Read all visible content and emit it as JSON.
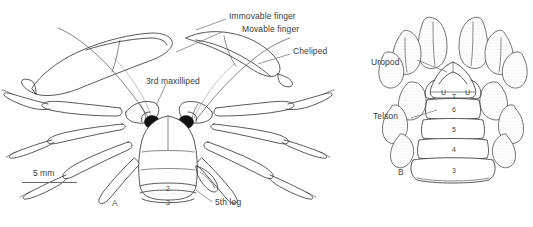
{
  "figure": {
    "background_color": "#ffffff",
    "ink_color": "#2e2e2e",
    "text_color": "#3b3b3b"
  },
  "panel_a": {
    "label": "A",
    "labels": [
      {
        "id": "immovable-finger",
        "text": "Immovable finger"
      },
      {
        "id": "movable-finger",
        "text": "Movable finger"
      },
      {
        "id": "cheliped",
        "text": "Cheliped"
      },
      {
        "id": "third-maxilliped",
        "text": "3rd maxilliped"
      },
      {
        "id": "fifth-leg",
        "text": "5th leg"
      }
    ],
    "segment_numbers": [
      "2",
      "3"
    ],
    "scale": {
      "text": "5 mm"
    }
  },
  "panel_b": {
    "label": "B",
    "labels": [
      {
        "id": "uropod",
        "text": "Uropod"
      },
      {
        "id": "telson",
        "text": "Telson"
      }
    ],
    "structure_letters": [
      "U",
      "T",
      "U"
    ],
    "segment_numbers": [
      "6",
      "5",
      "4",
      "3"
    ]
  }
}
